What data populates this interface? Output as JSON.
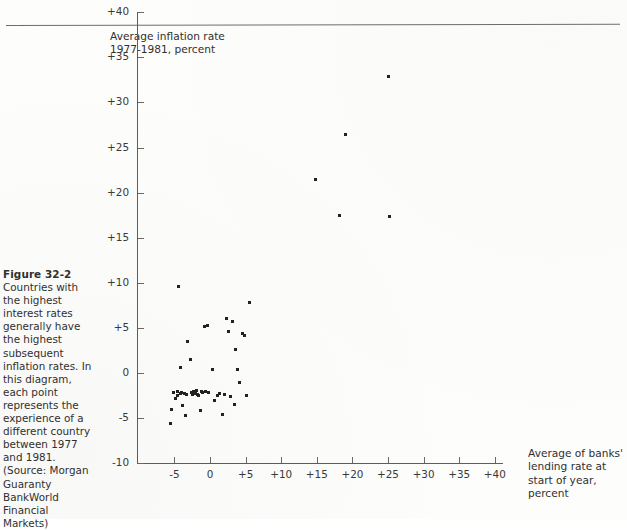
{
  "figure": {
    "number": "Figure 32-2",
    "caption": "Countries with the highest interest rates generally have the highest subsequent inflation rates. In this diagram, each point represents the experience of a different country between 1977 and 1981. (Source: Morgan Guaranty BankWorld Financial Markets)"
  },
  "chart_data": {
    "type": "scatter",
    "title": "",
    "subtitle": "",
    "xlabel": "Average of banks' lending rate at start of year, percent",
    "ylabel": "Average inflation rate 1977-1981, percent",
    "xlim": [
      -7.5,
      42
    ],
    "ylim": [
      -11,
      42
    ],
    "xticks": [
      -5,
      0,
      5,
      10,
      15,
      20,
      25,
      30,
      35,
      40
    ],
    "xtick_labels": [
      "-5",
      "0",
      "+5",
      "+10",
      "+15",
      "+20",
      "+25",
      "+30",
      "+35",
      "+40"
    ],
    "yticks": [
      -10,
      -5,
      0,
      5,
      10,
      15,
      20,
      25,
      30,
      35,
      40
    ],
    "ytick_labels": [
      "-10",
      "-5",
      "0",
      "+5",
      "+10",
      "+15",
      "+20",
      "+25",
      "+30",
      "+35",
      "+40"
    ],
    "grid": false,
    "legend": null,
    "marker_color": "#222220",
    "axis_color": "#5d5d5d",
    "points": [
      [
        -5.6,
        -5.6
      ],
      [
        -5.4,
        -4.1
      ],
      [
        -5.1,
        -2.2
      ],
      [
        -4.9,
        -2.8
      ],
      [
        -4.6,
        -2.0
      ],
      [
        -4.5,
        -2.5
      ],
      [
        -4.4,
        9.6
      ],
      [
        -4.2,
        -2.3
      ],
      [
        -4.1,
        0.6
      ],
      [
        -4.0,
        -2.2
      ],
      [
        -3.9,
        -3.6
      ],
      [
        -3.6,
        -2.3
      ],
      [
        -3.5,
        -4.7
      ],
      [
        -3.3,
        -2.4
      ],
      [
        -3.1,
        3.5
      ],
      [
        -2.8,
        1.5
      ],
      [
        -2.6,
        -2.2
      ],
      [
        -2.4,
        -2.4
      ],
      [
        -2.3,
        -2.1
      ],
      [
        -2.2,
        -2.3
      ],
      [
        -2.0,
        -2.2
      ],
      [
        -1.9,
        -1.9
      ],
      [
        -1.8,
        -2.4
      ],
      [
        -1.6,
        -2.5
      ],
      [
        -1.4,
        -4.2
      ],
      [
        -1.2,
        -2.0
      ],
      [
        -1.0,
        -2.2
      ],
      [
        -0.8,
        5.2
      ],
      [
        -0.6,
        -2.1
      ],
      [
        -0.4,
        5.3
      ],
      [
        -0.2,
        -2.2
      ],
      [
        0.3,
        0.4
      ],
      [
        0.6,
        -3.1
      ],
      [
        1.0,
        -2.5
      ],
      [
        1.4,
        -2.3
      ],
      [
        1.7,
        -4.6
      ],
      [
        2.0,
        -2.4
      ],
      [
        2.3,
        6.0
      ],
      [
        2.6,
        4.6
      ],
      [
        2.9,
        -2.6
      ],
      [
        3.2,
        5.7
      ],
      [
        3.4,
        -3.5
      ],
      [
        3.6,
        2.6
      ],
      [
        3.9,
        0.4
      ],
      [
        4.2,
        -1.0
      ],
      [
        4.5,
        4.4
      ],
      [
        4.8,
        4.2
      ],
      [
        5.1,
        -2.5
      ],
      [
        5.6,
        7.8
      ],
      [
        14.8,
        21.5
      ],
      [
        18.2,
        17.5
      ],
      [
        19.0,
        26.4
      ],
      [
        25.0,
        32.9
      ],
      [
        25.2,
        17.4
      ]
    ]
  }
}
